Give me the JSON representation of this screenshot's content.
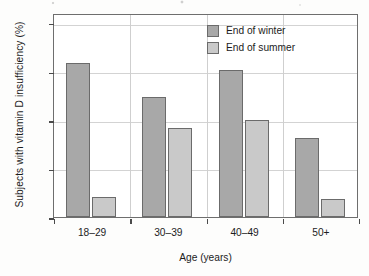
{
  "chart_data": {
    "type": "bar",
    "title": "",
    "xlabel": "Age (years)",
    "ylabel": "Subjects with vitamin D insufficiency (%)",
    "categories": [
      "18–29",
      "30–39",
      "40–49",
      "50+"
    ],
    "series": [
      {
        "name": "End of winter",
        "color": "#a8a8a8",
        "values": [
          31.8,
          24.8,
          30.3,
          16.2
        ]
      },
      {
        "name": "End of summer",
        "color": "#c9c9c9",
        "values": [
          4.1,
          18.4,
          19.9,
          3.7
        ]
      }
    ],
    "ylim": [
      0,
      42
    ],
    "yticks": [
      0,
      10,
      20,
      30,
      40
    ],
    "ytick_labels": [
      "0",
      "10",
      "20",
      "30",
      "40"
    ],
    "grid": "horizontal-and-category-separators",
    "legend_position": "top-right-inside"
  },
  "legend": {
    "items": [
      {
        "label": "End of winter"
      },
      {
        "label": "End of summer"
      }
    ]
  },
  "colors": {
    "winter": "#a8a8a8",
    "summer": "#c9c9c9",
    "bar_outline": "#6b6b6b",
    "frame": "#6e6e6e",
    "gridline": "#d3d3d3",
    "text": "#1c1c1c"
  }
}
